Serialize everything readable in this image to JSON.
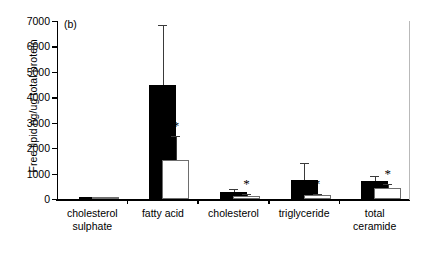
{
  "panel": {
    "label": "(b)"
  },
  "axes": {
    "ylabel": "Free lipid ng/ug total protein",
    "yticks": [
      0,
      1000,
      2000,
      3000,
      4000,
      5000,
      6000,
      7000
    ],
    "ytick_labels": [
      "0",
      "1000",
      "2000",
      "3000",
      "4000",
      "5000",
      "6000",
      "7000"
    ],
    "ylim": [
      0,
      7000
    ],
    "significance_marker": "*"
  },
  "chart_data": {
    "type": "bar",
    "title": "",
    "xlabel": "",
    "ylabel": "Free lipid ng/ug total protein",
    "ylim": [
      0,
      7000
    ],
    "grid": false,
    "legend": "none",
    "categories": [
      "cholesterol sulphate",
      "fatty acid",
      "cholesterol",
      "triglyceride",
      "total ceramide"
    ],
    "category_lines": [
      [
        "cholesterol",
        "sulphate"
      ],
      [
        "fatty acid"
      ],
      [
        "cholesterol"
      ],
      [
        "triglyceride"
      ],
      [
        "total",
        "ceramide"
      ]
    ],
    "series": [
      {
        "name": "black",
        "fill": "#000000",
        "values": [
          40,
          4500,
          280,
          760,
          710
        ],
        "errors_upper": [
          0,
          2350,
          110,
          660,
          190
        ],
        "significance": [
          false,
          false,
          false,
          false,
          false
        ]
      },
      {
        "name": "white",
        "fill": "#ffffff",
        "values": [
          10,
          1550,
          130,
          140,
          430
        ],
        "errors_upper": [
          0,
          930,
          60,
          60,
          150
        ],
        "significance": [
          false,
          true,
          true,
          true,
          true
        ]
      }
    ]
  }
}
